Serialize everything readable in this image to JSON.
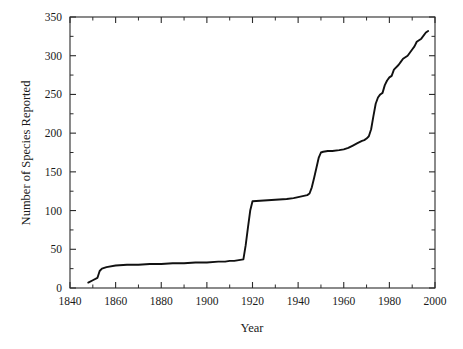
{
  "chart_data": {
    "type": "line",
    "title": "",
    "xlabel": "Year",
    "ylabel": "Number of Species Reported",
    "xlim": [
      1840,
      2000
    ],
    "ylim": [
      0,
      350
    ],
    "grid": false,
    "legend": null,
    "x_ticks": [
      1840,
      1860,
      1880,
      1900,
      1920,
      1940,
      1960,
      1980,
      2000
    ],
    "x_tick_labels": [
      "1840",
      "1860",
      "1880",
      "1900",
      "1920",
      "1940",
      "1960",
      "1980",
      "2000"
    ],
    "x_minor_tick_step": 10,
    "y_ticks": [
      0,
      50,
      100,
      150,
      200,
      250,
      300,
      350
    ],
    "y_tick_labels": [
      "0",
      "50",
      "100",
      "150",
      "200",
      "250",
      "300",
      "350"
    ],
    "y_minor_tick_step": 25,
    "line_color": "#111111",
    "series": [
      {
        "name": "Cumulative species reported",
        "x": [
          1848,
          1850,
          1852,
          1853,
          1854,
          1856,
          1860,
          1865,
          1870,
          1875,
          1880,
          1885,
          1890,
          1895,
          1900,
          1905,
          1908,
          1910,
          1912,
          1914,
          1916,
          1917,
          1918,
          1919,
          1920,
          1925,
          1930,
          1935,
          1938,
          1941,
          1944,
          1945,
          1946,
          1947,
          1948,
          1949,
          1950,
          1951,
          1953,
          1955,
          1958,
          1960,
          1962,
          1964,
          1966,
          1968,
          1969,
          1970,
          1971,
          1972,
          1973,
          1974,
          1975,
          1976,
          1977,
          1978,
          1979,
          1980,
          1981,
          1982,
          1984,
          1985,
          1986,
          1988,
          1990,
          1991,
          1992,
          1994,
          1996,
          1997
        ],
        "y": [
          7,
          10,
          13,
          22,
          25,
          27,
          29,
          30,
          30,
          31,
          31,
          32,
          32,
          33,
          33,
          34,
          34,
          35,
          35,
          36,
          37,
          55,
          78,
          100,
          112,
          113,
          114,
          115,
          116,
          118,
          120,
          122,
          130,
          142,
          155,
          168,
          175,
          176,
          177,
          177,
          178,
          179,
          181,
          184,
          187,
          190,
          191,
          193,
          196,
          205,
          222,
          238,
          246,
          250,
          252,
          262,
          268,
          272,
          274,
          282,
          288,
          292,
          296,
          300,
          308,
          312,
          318,
          322,
          330,
          332
        ]
      }
    ]
  },
  "axes": {
    "x_title": "Year",
    "y_title": "Number of Species Reported"
  }
}
